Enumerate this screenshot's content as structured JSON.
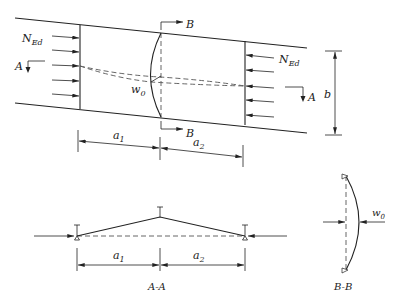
{
  "diagram": {
    "plan_view": {
      "load_label_left": "N",
      "load_label_left_sub": "Ed",
      "load_label_right": "N",
      "load_label_right_sub": "Ed",
      "section_a_left": "A",
      "section_a_right": "A",
      "section_b_top": "B",
      "section_b_bottom": "B",
      "imperfection_label": "w",
      "imperfection_sub": "0",
      "width_label": "b",
      "span1_label": "a",
      "span1_sub": "1",
      "span2_label": "a",
      "span2_sub": "2",
      "arrow_count_each_side": 5
    },
    "section_aa": {
      "caption": "A-A",
      "span1_label": "a",
      "span1_sub": "1",
      "span2_label": "a",
      "span2_sub": "2"
    },
    "section_bb": {
      "caption": "B-B",
      "imperfection_label": "w",
      "imperfection_sub": "0"
    },
    "colors": {
      "stroke": "#222222",
      "dashed": "#555555",
      "background": "#ffffff"
    }
  }
}
